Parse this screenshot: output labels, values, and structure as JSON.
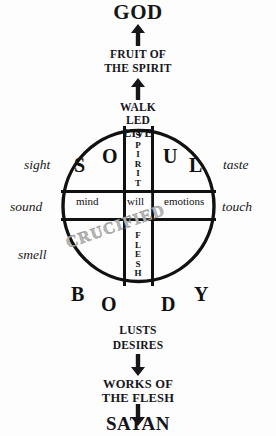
{
  "diagram": {
    "title": "GOD",
    "top_flow": {
      "god_label": "GOD",
      "fruit_line1": "FRUIT OF",
      "fruit_line2": "THE SPIRIT",
      "walk": "WALK",
      "led": "LED",
      "live": "LIVE"
    },
    "bottom_flow": {
      "lusts": "LUSTS",
      "desires": "DESIRES",
      "works_line1": "WORKS OF",
      "works_line2": "THE FLESH",
      "satan_label": "SATAN"
    },
    "circle": {
      "soul_letters": [
        "S",
        "O",
        "U",
        "L"
      ],
      "body_letters": [
        "B",
        "O",
        "D",
        "Y"
      ],
      "vertical_top": "SPIRIT",
      "vertical_bottom": "FLESH",
      "bar_left": "mind",
      "bar_center": "will",
      "bar_right": "emotions",
      "watermark": "CRUCIFIED"
    },
    "senses": {
      "sight": "sight",
      "sound": "sound",
      "smell": "smell",
      "taste": "taste",
      "touch": "touch"
    },
    "colors": {
      "background": "#fdfdfd",
      "ink": "#16161a",
      "watermark": "#b6b6b6"
    }
  }
}
